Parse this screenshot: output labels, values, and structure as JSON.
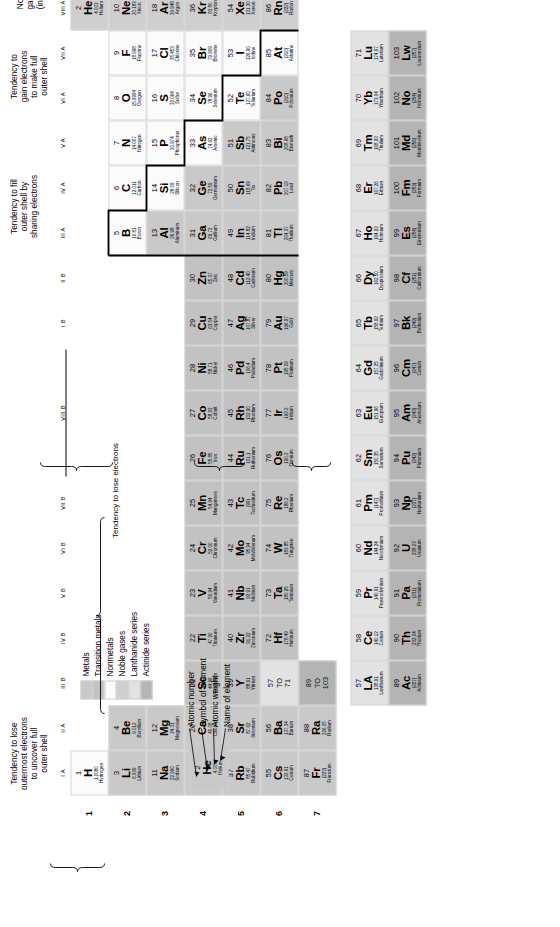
{
  "legend": {
    "items": [
      {
        "label": "Metals",
        "color": "#c9c9c9"
      },
      {
        "label": "Transition metals",
        "color": "#c2c2c2"
      },
      {
        "label": "Nonmetals",
        "color": "#fbfbfb"
      },
      {
        "label": "Noble gases",
        "color": "#cfcfcf"
      },
      {
        "label": "Lanthanide series",
        "color": "#e2e2e2"
      },
      {
        "label": "Actinide series",
        "color": "#b4b4b4"
      }
    ]
  },
  "key": {
    "cell": {
      "number": "2",
      "symbol": "He",
      "weight": "4.003",
      "name": "Helium"
    },
    "labels": [
      "Atomic number",
      "Symbol of element",
      "Atomic weight",
      "Name of element"
    ]
  },
  "annotations": {
    "lose": "Tendency to lose\noutermost electrons\nto uncover full\nouter shell",
    "transition": "Tendency to lose electrons",
    "share": "Tendency to fill\nouter shell by\nsharing electrons",
    "gain": "Tendency to\ngain electrons\nto make full\nouter shell",
    "noble": "Noble\ngases\n(inert)"
  },
  "group_labels": [
    "I A",
    "II A",
    "III B",
    "IV B",
    "V B",
    "VI B",
    "VII B",
    "VIII B",
    "I B",
    "II B",
    "III A",
    "IV A",
    "V A",
    "VI A",
    "VII A",
    "VIII A"
  ],
  "row_labels": [
    "1",
    "2",
    "3",
    "4",
    "5",
    "6",
    "7"
  ],
  "placeholders": {
    "lanthanide": "57\nTO\n71",
    "actinide": "89\nTO\n103"
  },
  "elements": [
    {
      "n": "1",
      "s": "H",
      "w": "1.0080",
      "e": "Hydrogen",
      "g": 1,
      "p": 1,
      "c": "nonmetal"
    },
    {
      "n": "2",
      "s": "He",
      "w": "4.003",
      "e": "Helium",
      "g": 18,
      "p": 1,
      "c": "noble"
    },
    {
      "n": "3",
      "s": "Li",
      "w": "6.939",
      "e": "Lithium",
      "g": 1,
      "p": 2,
      "c": "metal"
    },
    {
      "n": "4",
      "s": "Be",
      "w": "9.012",
      "e": "Beryllium",
      "g": 2,
      "p": 2,
      "c": "metal"
    },
    {
      "n": "5",
      "s": "B",
      "w": "10.81",
      "e": "Boron",
      "g": 13,
      "p": 2,
      "c": "nonmetal"
    },
    {
      "n": "6",
      "s": "C",
      "w": "12.011",
      "e": "Carbon",
      "g": 14,
      "p": 2,
      "c": "nonmetal"
    },
    {
      "n": "7",
      "s": "N",
      "w": "14.007",
      "e": "Nitrogen",
      "g": 15,
      "p": 2,
      "c": "nonmetal"
    },
    {
      "n": "8",
      "s": "O",
      "w": "15.9994",
      "e": "Oxygen",
      "g": 16,
      "p": 2,
      "c": "nonmetal"
    },
    {
      "n": "9",
      "s": "F",
      "w": "18.998",
      "e": "Fluorine",
      "g": 17,
      "p": 2,
      "c": "nonmetal"
    },
    {
      "n": "10",
      "s": "Ne",
      "w": "20.183",
      "e": "Neon",
      "g": 18,
      "p": 2,
      "c": "noble"
    },
    {
      "n": "11",
      "s": "Na",
      "w": "22.990",
      "e": "Sodium",
      "g": 1,
      "p": 3,
      "c": "metal"
    },
    {
      "n": "12",
      "s": "Mg",
      "w": "24.31",
      "e": "Magnesium",
      "g": 2,
      "p": 3,
      "c": "metal"
    },
    {
      "n": "13",
      "s": "Al",
      "w": "26.98",
      "e": "Aluminum",
      "g": 13,
      "p": 3,
      "c": "metal"
    },
    {
      "n": "14",
      "s": "Si",
      "w": "28.09",
      "e": "Silicon",
      "g": 14,
      "p": 3,
      "c": "nonmetal"
    },
    {
      "n": "15",
      "s": "P",
      "w": "30.974",
      "e": "Phosphorus",
      "g": 15,
      "p": 3,
      "c": "nonmetal"
    },
    {
      "n": "16",
      "s": "S",
      "w": "32.064",
      "e": "Sulfur",
      "g": 16,
      "p": 3,
      "c": "nonmetal"
    },
    {
      "n": "17",
      "s": "Cl",
      "w": "35.453",
      "e": "Chlorine",
      "g": 17,
      "p": 3,
      "c": "nonmetal"
    },
    {
      "n": "18",
      "s": "Ar",
      "w": "39.948",
      "e": "Argon",
      "g": 18,
      "p": 3,
      "c": "noble"
    },
    {
      "n": "19",
      "s": "K",
      "w": "39.102",
      "e": "Potassium",
      "g": 1,
      "p": 4,
      "c": "metal"
    },
    {
      "n": "20",
      "s": "Ca",
      "w": "40.08",
      "e": "Calcium",
      "g": 2,
      "p": 4,
      "c": "metal"
    },
    {
      "n": "21",
      "s": "Sc",
      "w": "44.96",
      "e": "Scandium",
      "g": 3,
      "p": 4,
      "c": "transition"
    },
    {
      "n": "22",
      "s": "Ti",
      "w": "47.90",
      "e": "Titanium",
      "g": 4,
      "p": 4,
      "c": "transition"
    },
    {
      "n": "23",
      "s": "V",
      "w": "50.94",
      "e": "Vanadium",
      "g": 5,
      "p": 4,
      "c": "transition"
    },
    {
      "n": "24",
      "s": "Cr",
      "w": "52.00",
      "e": "Chromium",
      "g": 6,
      "p": 4,
      "c": "transition"
    },
    {
      "n": "25",
      "s": "Mn",
      "w": "54.94",
      "e": "Manganese",
      "g": 7,
      "p": 4,
      "c": "transition"
    },
    {
      "n": "26",
      "s": "Fe",
      "w": "55.85",
      "e": "Iron",
      "g": 8,
      "p": 4,
      "c": "transition"
    },
    {
      "n": "27",
      "s": "Co",
      "w": "58.93",
      "e": "Cobalt",
      "g": 9,
      "p": 4,
      "c": "transition"
    },
    {
      "n": "28",
      "s": "Ni",
      "w": "58.71",
      "e": "Nickel",
      "g": 10,
      "p": 4,
      "c": "transition"
    },
    {
      "n": "29",
      "s": "Cu",
      "w": "63.54",
      "e": "Copper",
      "g": 11,
      "p": 4,
      "c": "transition"
    },
    {
      "n": "30",
      "s": "Zn",
      "w": "65.37",
      "e": "Zinc",
      "g": 12,
      "p": 4,
      "c": "transition"
    },
    {
      "n": "31",
      "s": "Ga",
      "w": "69.72",
      "e": "Gallium",
      "g": 13,
      "p": 4,
      "c": "metal"
    },
    {
      "n": "32",
      "s": "Ge",
      "w": "72.59",
      "e": "Germanium",
      "g": 14,
      "p": 4,
      "c": "metal"
    },
    {
      "n": "33",
      "s": "As",
      "w": "74.92",
      "e": "Arsenic",
      "g": 15,
      "p": 4,
      "c": "nonmetal"
    },
    {
      "n": "34",
      "s": "Se",
      "w": "78.96",
      "e": "Selenium",
      "g": 16,
      "p": 4,
      "c": "nonmetal"
    },
    {
      "n": "35",
      "s": "Br",
      "w": "79.909",
      "e": "Bromine",
      "g": 17,
      "p": 4,
      "c": "nonmetal"
    },
    {
      "n": "36",
      "s": "Kr",
      "w": "83.80",
      "e": "Krypton",
      "g": 18,
      "p": 4,
      "c": "noble"
    },
    {
      "n": "37",
      "s": "Rb",
      "w": "85.47",
      "e": "Rubidium",
      "g": 1,
      "p": 5,
      "c": "metal"
    },
    {
      "n": "38",
      "s": "Sr",
      "w": "87.62",
      "e": "Strontium",
      "g": 2,
      "p": 5,
      "c": "metal"
    },
    {
      "n": "39",
      "s": "Y",
      "w": "88.91",
      "e": "Yttrium",
      "g": 3,
      "p": 5,
      "c": "transition"
    },
    {
      "n": "40",
      "s": "Zr",
      "w": "91.22",
      "e": "Zirconium",
      "g": 4,
      "p": 5,
      "c": "transition"
    },
    {
      "n": "41",
      "s": "Nb",
      "w": "92.91",
      "e": "Niobium",
      "g": 5,
      "p": 5,
      "c": "transition"
    },
    {
      "n": "42",
      "s": "Mo",
      "w": "95.94",
      "e": "Molybdenum",
      "g": 6,
      "p": 5,
      "c": "transition"
    },
    {
      "n": "43",
      "s": "Tc",
      "w": "(99)",
      "e": "Technetium",
      "g": 7,
      "p": 5,
      "c": "transition"
    },
    {
      "n": "44",
      "s": "Ru",
      "w": "101.1",
      "e": "Ruthenium",
      "g": 8,
      "p": 5,
      "c": "transition"
    },
    {
      "n": "45",
      "s": "Rh",
      "w": "102.90",
      "e": "Rhodium",
      "g": 9,
      "p": 5,
      "c": "transition"
    },
    {
      "n": "46",
      "s": "Pd",
      "w": "106.4",
      "e": "Palladium",
      "g": 10,
      "p": 5,
      "c": "transition"
    },
    {
      "n": "47",
      "s": "Ag",
      "w": "107.87",
      "e": "Silver",
      "g": 11,
      "p": 5,
      "c": "transition"
    },
    {
      "n": "48",
      "s": "Cd",
      "w": "112.40",
      "e": "Cadmium",
      "g": 12,
      "p": 5,
      "c": "transition"
    },
    {
      "n": "49",
      "s": "In",
      "w": "114.82",
      "e": "Indium",
      "g": 13,
      "p": 5,
      "c": "metal"
    },
    {
      "n": "50",
      "s": "Sn",
      "w": "118.69",
      "e": "Tin",
      "g": 14,
      "p": 5,
      "c": "metal"
    },
    {
      "n": "51",
      "s": "Sb",
      "w": "121.75",
      "e": "Antimony",
      "g": 15,
      "p": 5,
      "c": "metal"
    },
    {
      "n": "52",
      "s": "Te",
      "w": "127.60",
      "e": "Tellurium",
      "g": 16,
      "p": 5,
      "c": "nonmetal"
    },
    {
      "n": "53",
      "s": "I",
      "w": "126.90",
      "e": "Iodine",
      "g": 17,
      "p": 5,
      "c": "nonmetal"
    },
    {
      "n": "54",
      "s": "Xe",
      "w": "131.30",
      "e": "Xenon",
      "g": 18,
      "p": 5,
      "c": "noble"
    },
    {
      "n": "55",
      "s": "Cs",
      "w": "132.91",
      "e": "Cesium",
      "g": 1,
      "p": 6,
      "c": "metal"
    },
    {
      "n": "56",
      "s": "Ba",
      "w": "137.34",
      "e": "Barium",
      "g": 2,
      "p": 6,
      "c": "metal"
    },
    {
      "n": "72",
      "s": "Hf",
      "w": "178.49",
      "e": "Hafnium",
      "g": 4,
      "p": 6,
      "c": "transition"
    },
    {
      "n": "73",
      "s": "Ta",
      "w": "180.95",
      "e": "Tantalum",
      "g": 5,
      "p": 6,
      "c": "transition"
    },
    {
      "n": "74",
      "s": "W",
      "w": "183.85",
      "e": "Tungsten",
      "g": 6,
      "p": 6,
      "c": "transition"
    },
    {
      "n": "75",
      "s": "Re",
      "w": "186.2",
      "e": "Rhenium",
      "g": 7,
      "p": 6,
      "c": "transition"
    },
    {
      "n": "76",
      "s": "Os",
      "w": "190.2",
      "e": "Osmium",
      "g": 8,
      "p": 6,
      "c": "transition"
    },
    {
      "n": "77",
      "s": "Ir",
      "w": "192.2",
      "e": "Iridium",
      "g": 9,
      "p": 6,
      "c": "transition"
    },
    {
      "n": "78",
      "s": "Pt",
      "w": "195.09",
      "e": "Platinum",
      "g": 10,
      "p": 6,
      "c": "transition"
    },
    {
      "n": "79",
      "s": "Au",
      "w": "196.97",
      "e": "Gold",
      "g": 11,
      "p": 6,
      "c": "transition"
    },
    {
      "n": "80",
      "s": "Hg",
      "w": "200.59",
      "e": "Mercury",
      "g": 12,
      "p": 6,
      "c": "transition"
    },
    {
      "n": "81",
      "s": "Tl",
      "w": "204.37",
      "e": "Thallium",
      "g": 13,
      "p": 6,
      "c": "metal"
    },
    {
      "n": "82",
      "s": "Pb",
      "w": "207.19",
      "e": "Lead",
      "g": 14,
      "p": 6,
      "c": "metal"
    },
    {
      "n": "83",
      "s": "Bi",
      "w": "208.98",
      "e": "Bismuth",
      "g": 15,
      "p": 6,
      "c": "metal"
    },
    {
      "n": "84",
      "s": "Po",
      "w": "(210)",
      "e": "Polonium",
      "g": 16,
      "p": 6,
      "c": "metal"
    },
    {
      "n": "85",
      "s": "At",
      "w": "(210)",
      "e": "Astatine",
      "g": 17,
      "p": 6,
      "c": "nonmetal"
    },
    {
      "n": "86",
      "s": "Rn",
      "w": "(222)",
      "e": "Radon",
      "g": 18,
      "p": 6,
      "c": "noble"
    },
    {
      "n": "87",
      "s": "Fr",
      "w": "(223)",
      "e": "Francium",
      "g": 1,
      "p": 7,
      "c": "metal"
    },
    {
      "n": "88",
      "s": "Ra",
      "w": "226.05",
      "e": "Radium",
      "g": 2,
      "p": 7,
      "c": "metal"
    }
  ],
  "lanthanides": [
    {
      "n": "57",
      "s": "LA",
      "w": "138.91",
      "e": "Lanthanum"
    },
    {
      "n": "58",
      "s": "Ce",
      "w": "140.12",
      "e": "Cerium"
    },
    {
      "n": "59",
      "s": "Pr",
      "w": "140.91",
      "e": "Praseodymium"
    },
    {
      "n": "60",
      "s": "Nd",
      "w": "144.24",
      "e": "Neodymium"
    },
    {
      "n": "61",
      "s": "Pm",
      "w": "(147)",
      "e": "Promethium"
    },
    {
      "n": "62",
      "s": "Sm",
      "w": "150.35",
      "e": "Samarium"
    },
    {
      "n": "63",
      "s": "Eu",
      "w": "151.96",
      "e": "Europium"
    },
    {
      "n": "64",
      "s": "Gd",
      "w": "157.25",
      "e": "Gadolinium"
    },
    {
      "n": "65",
      "s": "Tb",
      "w": "158.92",
      "e": "Terbium"
    },
    {
      "n": "66",
      "s": "Dy",
      "w": "162.50",
      "e": "Dysprosium"
    },
    {
      "n": "67",
      "s": "Ho",
      "w": "164.93",
      "e": "Holmium"
    },
    {
      "n": "68",
      "s": "Er",
      "w": "167.26",
      "e": "Erbium"
    },
    {
      "n": "69",
      "s": "Tm",
      "w": "168.93",
      "e": "Thulium"
    },
    {
      "n": "70",
      "s": "Yb",
      "w": "173.04",
      "e": "Ytterbium"
    },
    {
      "n": "71",
      "s": "Lu",
      "w": "174.97",
      "e": "Lutetium"
    }
  ],
  "actinides": [
    {
      "n": "89",
      "s": "Ac",
      "w": "(227)",
      "e": "Actinium"
    },
    {
      "n": "90",
      "s": "Th",
      "w": "232.04",
      "e": "Thorium"
    },
    {
      "n": "91",
      "s": "Pa",
      "w": "(231)",
      "e": "Protactinium"
    },
    {
      "n": "92",
      "s": "U",
      "w": "238.03",
      "e": "Uranium"
    },
    {
      "n": "93",
      "s": "Np",
      "w": "(237)",
      "e": "Neptunium"
    },
    {
      "n": "94",
      "s": "Pu",
      "w": "(242)",
      "e": "Plutonium"
    },
    {
      "n": "95",
      "s": "Am",
      "w": "(243)",
      "e": "Americium"
    },
    {
      "n": "96",
      "s": "Cm",
      "w": "(247)",
      "e": "Curium"
    },
    {
      "n": "97",
      "s": "Bk",
      "w": "(249)",
      "e": "Berkelium"
    },
    {
      "n": "98",
      "s": "Cf",
      "w": "(251)",
      "e": "Californium"
    },
    {
      "n": "99",
      "s": "Es",
      "w": "(254)",
      "e": "Einsteinium"
    },
    {
      "n": "100",
      "s": "Fm",
      "w": "(253)",
      "e": "Fermium"
    },
    {
      "n": "101",
      "s": "Md",
      "w": "(256)",
      "e": "Mendelevium"
    },
    {
      "n": "102",
      "s": "No",
      "w": "(254)",
      "e": "Nobelium"
    },
    {
      "n": "103",
      "s": "Lw",
      "w": "(257)",
      "e": "Lawrencium"
    }
  ]
}
